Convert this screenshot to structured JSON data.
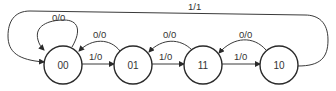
{
  "diagram": {
    "type": "state-transition-diagram",
    "states": [
      {
        "id": "s00",
        "label": "00"
      },
      {
        "id": "s01",
        "label": "01"
      },
      {
        "id": "s11",
        "label": "11"
      },
      {
        "id": "s10",
        "label": "10"
      }
    ],
    "transitions": [
      {
        "from": "00",
        "to": "00",
        "label": "0/0"
      },
      {
        "from": "00",
        "to": "01",
        "label": "1/0"
      },
      {
        "from": "01",
        "to": "00",
        "label": "0/0"
      },
      {
        "from": "01",
        "to": "11",
        "label": "1/0"
      },
      {
        "from": "11",
        "to": "01",
        "label": "0/0"
      },
      {
        "from": "11",
        "to": "10",
        "label": "1/0"
      },
      {
        "from": "10",
        "to": "11",
        "label": "0/0"
      },
      {
        "from": "10",
        "to": "00",
        "label": "1/1"
      }
    ]
  }
}
